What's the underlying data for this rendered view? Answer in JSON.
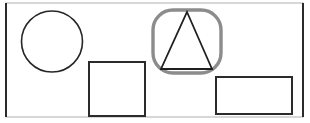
{
  "figure": {
    "title": "Geometric shapes line drawing",
    "background_color": "#ffffff",
    "width": 310,
    "height": 123
  },
  "frame": {
    "name": "outer-border",
    "stroke_color": "#2b2b2b",
    "faint_stroke_color": "#bdbdbd",
    "stroke_width": 2,
    "x": 6,
    "y": 3,
    "width": 297,
    "height": 114
  },
  "shapes": [
    {
      "id": "circle",
      "label": "Circle",
      "type": "circle",
      "stroke_color": "#262626",
      "stroke_width": 1.6,
      "fill": "none",
      "cx": 52,
      "cy": 41.5,
      "r": 30.5
    },
    {
      "id": "square",
      "label": "Square",
      "type": "rect",
      "stroke_color": "#2b2b2b",
      "stroke_width": 2,
      "fill": "none",
      "x": 89,
      "y": 62,
      "width": 56,
      "height": 54
    },
    {
      "id": "rounded-square",
      "label": "Rounded square",
      "type": "rounded-rect",
      "stroke_color": "#8c8c8c",
      "stroke_width": 3.4,
      "fill": "none",
      "x": 153,
      "y": 10,
      "width": 68,
      "height": 63,
      "rx": 20
    },
    {
      "id": "triangle",
      "label": "Triangle",
      "type": "polygon",
      "stroke_color": "#1f1f1f",
      "stroke_width": 1.8,
      "fill": "none",
      "points": "187,12 212,69 161,69"
    },
    {
      "id": "rectangle",
      "label": "Rectangle",
      "type": "rect",
      "stroke_color": "#2b2b2b",
      "stroke_width": 2,
      "fill": "none",
      "x": 216,
      "y": 77,
      "width": 76,
      "height": 37
    }
  ],
  "caption": ""
}
